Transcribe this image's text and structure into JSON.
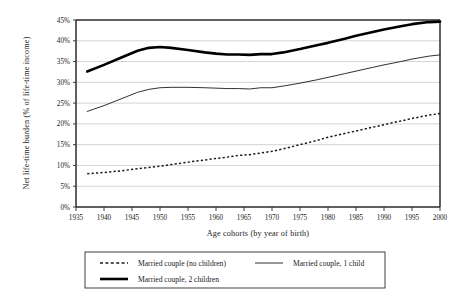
{
  "chart_data": {
    "type": "line",
    "title": "",
    "xlabel": "Age cohorts (by year of birth)",
    "ylabel": "Net life-time burden (% of life-time income)",
    "xlim": [
      1935,
      2000
    ],
    "ylim": [
      0,
      45
    ],
    "grid": true,
    "legend_position": "bottom",
    "xticks": [
      "1935",
      "1940",
      "1945",
      "1950",
      "1955",
      "1960",
      "1965",
      "1970",
      "1975",
      "1980",
      "1985",
      "1990",
      "1995",
      "2000"
    ],
    "yticks": [
      "0%",
      "5%",
      "10%",
      "15%",
      "20%",
      "25%",
      "30%",
      "35%",
      "40%",
      "45%"
    ],
    "x": [
      1937,
      1940,
      1943,
      1946,
      1948,
      1950,
      1952,
      1955,
      1958,
      1960,
      1962,
      1964,
      1966,
      1968,
      1970,
      1972,
      1975,
      1978,
      1980,
      1983,
      1985,
      1988,
      1990,
      1993,
      1995,
      1998,
      2000
    ],
    "series": [
      {
        "name": "Married couple (no children)",
        "style": "dashed",
        "values": [
          8.0,
          8.3,
          8.7,
          9.2,
          9.5,
          9.8,
          10.2,
          10.8,
          11.3,
          11.7,
          12.0,
          12.4,
          12.6,
          13.0,
          13.4,
          14.0,
          15.0,
          16.0,
          16.8,
          17.7,
          18.3,
          19.2,
          19.8,
          20.7,
          21.3,
          22.1,
          22.5
        ]
      },
      {
        "name": "Married couple, 1 child",
        "style": "thin-solid",
        "values": [
          23.0,
          24.4,
          26.0,
          27.6,
          28.3,
          28.7,
          28.8,
          28.8,
          28.7,
          28.6,
          28.5,
          28.5,
          28.4,
          28.7,
          28.7,
          29.1,
          29.8,
          30.6,
          31.2,
          32.1,
          32.7,
          33.6,
          34.2,
          35.0,
          35.6,
          36.3,
          36.6
        ]
      },
      {
        "name": "Married couple, 2 children",
        "style": "thick-solid",
        "values": [
          32.6,
          34.2,
          35.9,
          37.6,
          38.3,
          38.5,
          38.3,
          37.8,
          37.2,
          36.9,
          36.7,
          36.7,
          36.6,
          36.8,
          36.8,
          37.2,
          38.0,
          38.9,
          39.5,
          40.5,
          41.2,
          42.1,
          42.7,
          43.5,
          44.0,
          44.5,
          44.6
        ]
      }
    ]
  },
  "legend": {
    "entries": [
      {
        "label": "Married couple (no children)"
      },
      {
        "label": "Married couple, 1 child"
      },
      {
        "label": "Married couple, 2 children"
      }
    ]
  }
}
